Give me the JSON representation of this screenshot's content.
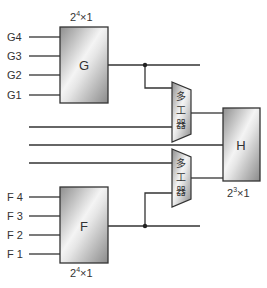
{
  "diagram": {
    "blocks": {
      "G": {
        "label": "G",
        "size": "2",
        "exp": "4",
        "suffix": "×1",
        "inputs": [
          "G4",
          "G3",
          "G2",
          "G1"
        ]
      },
      "F": {
        "label": "F",
        "size": "2",
        "exp": "4",
        "suffix": "×1",
        "inputs": [
          "F 4",
          "F 3",
          "F 2",
          "F 1"
        ]
      },
      "H": {
        "label": "H",
        "size": "2",
        "exp": "3",
        "suffix": "×1"
      }
    },
    "muxes": [
      {
        "id": "mux-top",
        "label_chars": [
          "多",
          "工",
          "器"
        ]
      },
      {
        "id": "mux-bottom",
        "label_chars": [
          "多",
          "工",
          "器"
        ]
      }
    ],
    "colors": {
      "line": "#333333",
      "box_fill_light": "#f2f2f2",
      "box_fill_dark": "#9a9a9a"
    }
  }
}
